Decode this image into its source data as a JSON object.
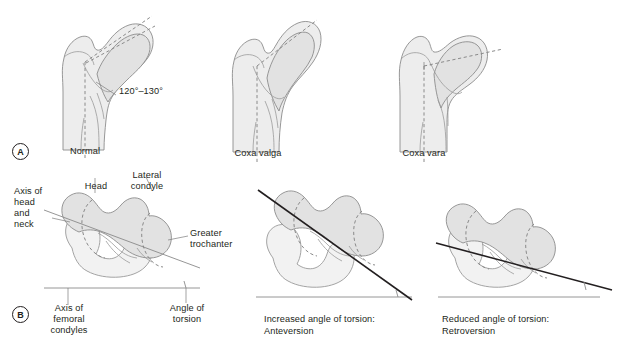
{
  "figure": {
    "background": "#ffffff",
    "bone_fill": "#ededed",
    "bone_fill_dark": "#dcdcdc",
    "outline_color": "#8c8c8c",
    "axis_color": "#231f20",
    "dashed_color": "#8a8a8a"
  },
  "panel_a": {
    "marker": "A",
    "items": [
      {
        "label": "Normal",
        "angle_label": "120°–130°"
      },
      {
        "label": "Coxa valga"
      },
      {
        "label": "Coxa vara"
      }
    ]
  },
  "panel_b": {
    "marker": "B",
    "labels": {
      "axis_head_neck": "Axis of\nhead\nand\nneck",
      "head": "Head",
      "lateral_condyle": "Lateral\ncondyle",
      "greater_trochanter": "Greater\ntrochanter",
      "axis_femoral_condyles": "Axis of\nfemoral\ncondyles",
      "angle_of_torsion": "Angle of\ntorsion"
    },
    "items": [
      {
        "caption_line1": "Increased angle of torsion:",
        "caption_line2": "Anteversion"
      },
      {
        "caption_line1": "Reduced angle of torsion:",
        "caption_line2": "Retroversion"
      }
    ]
  }
}
